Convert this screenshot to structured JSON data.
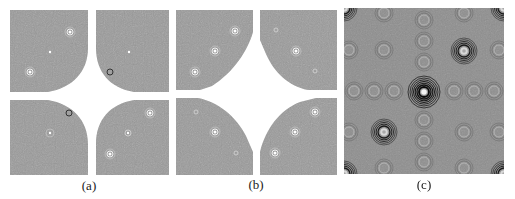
{
  "figure": {
    "panels": [
      {
        "id": "a",
        "caption": "(a)",
        "description": "Hologram spectrum with four quadrant regions; central star-shaped region filtered out (white)",
        "background": "#9a9a9a"
      },
      {
        "id": "b",
        "caption": "(b)",
        "description": "Hologram spectrum with four quadrant regions; central diamond-shaped region filtered out (white)",
        "background": "#9a9a9a"
      },
      {
        "id": "c",
        "caption": "(c)",
        "description": "Full interference pattern with concentric ring (Fresnel zone) patterns",
        "background": "#8c8c8c"
      }
    ]
  },
  "colors": {
    "gray": "#9a9a9a",
    "white": "#ffffff",
    "dark": "#1a1a1a"
  }
}
